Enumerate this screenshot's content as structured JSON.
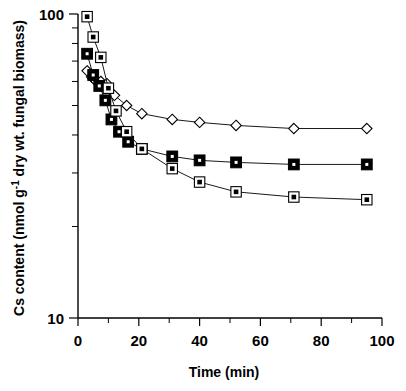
{
  "chart_data": {
    "type": "line",
    "title": "",
    "xlabel": "Time (min)",
    "ylabel": "Cs content (nmol g⁻¹ dry wt. fungal biomass)",
    "ylabel_parts": {
      "prefix": "Cs content (nmol g",
      "exponent": "-1",
      "suffix": " dry wt. fungal biomass)"
    },
    "xlim": [
      0,
      100
    ],
    "ylim": [
      10,
      100
    ],
    "yscale": "log",
    "xscale": "linear",
    "grid": false,
    "legend": "none",
    "x_major_ticks": [
      0,
      20,
      40,
      60,
      80,
      100
    ],
    "x_minor_ticks": [
      10,
      30,
      50,
      70,
      90
    ],
    "x_tick_labels": [
      "0",
      "20",
      "40",
      "60",
      "80",
      "100"
    ],
    "y_major_ticks": [
      10,
      100
    ],
    "y_tick_labels": [
      "10",
      "100"
    ],
    "y_minor_ticks": [
      20,
      30,
      40,
      50,
      60,
      70,
      80,
      90
    ],
    "series": [
      {
        "name": "open-diamond-series",
        "marker": "open-diamond",
        "x": [
          3.0,
          4.5,
          6.0,
          7.5,
          9.5,
          12.0,
          16.0,
          21.0,
          31.0,
          40.0,
          52.0,
          71.0,
          95.0
        ],
        "values": [
          65.0,
          62.0,
          60.0,
          60.0,
          59.0,
          54.0,
          50.0,
          47.0,
          45.0,
          44.0,
          43.0,
          42.0,
          42.0
        ]
      },
      {
        "name": "filled-square-series",
        "marker": "filled-square",
        "x": [
          3.0,
          5.0,
          7.0,
          9.0,
          11.0,
          13.5,
          16.5,
          21.0,
          31.0,
          40.0,
          52.0,
          71.0,
          95.0
        ],
        "values": [
          74.0,
          63.0,
          58.0,
          52.0,
          45.0,
          41.0,
          38.0,
          36.0,
          34.0,
          33.0,
          32.5,
          32.0,
          32.0
        ]
      },
      {
        "name": "open-square-dot-series",
        "marker": "open-square-dot",
        "x": [
          3.0,
          5.0,
          7.5,
          10.0,
          12.5,
          16.0,
          21.0,
          31.0,
          40.0,
          52.0,
          71.0,
          95.0
        ],
        "values": [
          98.0,
          84.0,
          72.0,
          57.0,
          48.0,
          41.0,
          36.0,
          31.0,
          28.0,
          26.0,
          25.0,
          24.5
        ]
      }
    ]
  }
}
